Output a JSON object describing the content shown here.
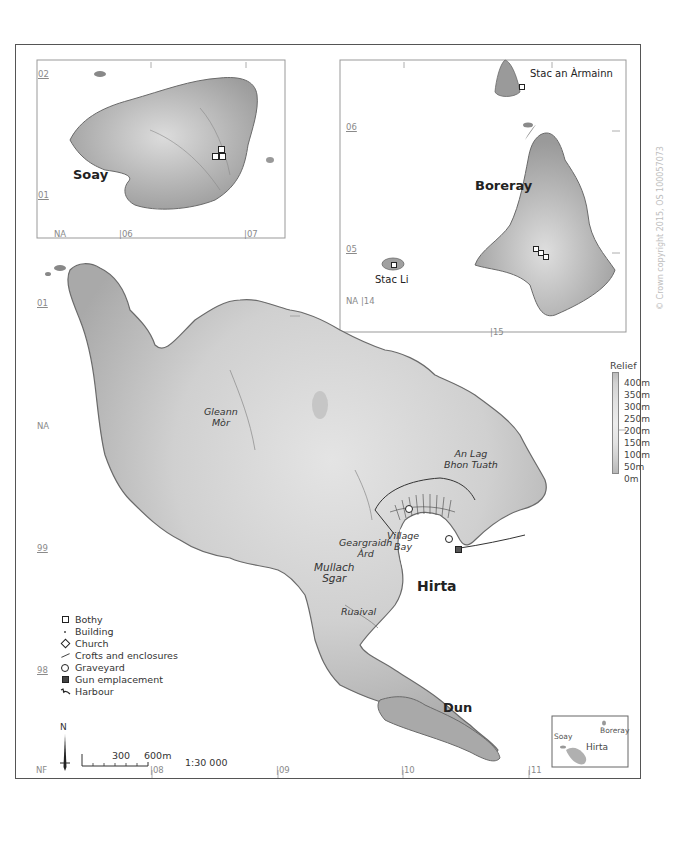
{
  "map": {
    "title": "St Kilda archipelago",
    "scale_ratio": "1:30 000",
    "scale_bar": {
      "labels": [
        "300",
        "600m"
      ]
    },
    "north_arrow": "N",
    "copyright": "© Crown copyright 2015, OS 100057073"
  },
  "places": {
    "soay": "Soay",
    "boreray": "Boreray",
    "stac_an_armainn": "Stac an Àrmainn",
    "stac_li": "Stac Li",
    "hirta": "Hirta",
    "dun": "Dun",
    "gleann_mor_1": "Gleann",
    "gleann_mor_2": "Mòr",
    "an_lag_1": "An Lag",
    "an_lag_2": "Bhon Tuath",
    "geargraidh_1": "Geargraidh",
    "geargraidh_2": "Àrd",
    "village_1": "Village",
    "village_2": "Bay",
    "mullach_1": "Mullach",
    "mullach_2": "Sgar",
    "ruaival": "Ruaival"
  },
  "grid_labels": {
    "soay_inset": {
      "n02": "02",
      "n01": "01",
      "na": "NA",
      "e06": "06",
      "e07": "07"
    },
    "boreray_inset": {
      "n06": "06",
      "n05": "05",
      "na": "NA",
      "e14": "14",
      "e15": "15"
    },
    "main": {
      "n01": "01",
      "na": "NA",
      "n99": "99",
      "n98": "98",
      "nf": "NF",
      "e08": "08",
      "e09": "09",
      "e10": "10",
      "e11": "11"
    }
  },
  "relief_legend": {
    "title": "Relief",
    "levels": [
      "400m",
      "350m",
      "300m",
      "250m",
      "200m",
      "150m",
      "100m",
      "50m",
      "0m"
    ]
  },
  "legend": {
    "items": [
      {
        "symbol": "square-outline",
        "label": "Bothy"
      },
      {
        "symbol": "small-dot",
        "label": "Building"
      },
      {
        "symbol": "diamond",
        "label": "Church"
      },
      {
        "symbol": "line",
        "label": "Crofts and enclosures"
      },
      {
        "symbol": "circle-outline",
        "label": "Graveyard"
      },
      {
        "symbol": "filled-square",
        "label": "Gun emplacement"
      },
      {
        "symbol": "harbour",
        "label": "Harbour"
      }
    ]
  },
  "locator": {
    "soay": "Soay",
    "boreray": "Boreray",
    "hirta": "Hirta"
  },
  "colors": {
    "land_low": "#a8a8a8",
    "land_high": "#e6e6e6",
    "coast": "#6a6a6a",
    "frame": "#555555",
    "grid_text": "#8a8a8a"
  }
}
